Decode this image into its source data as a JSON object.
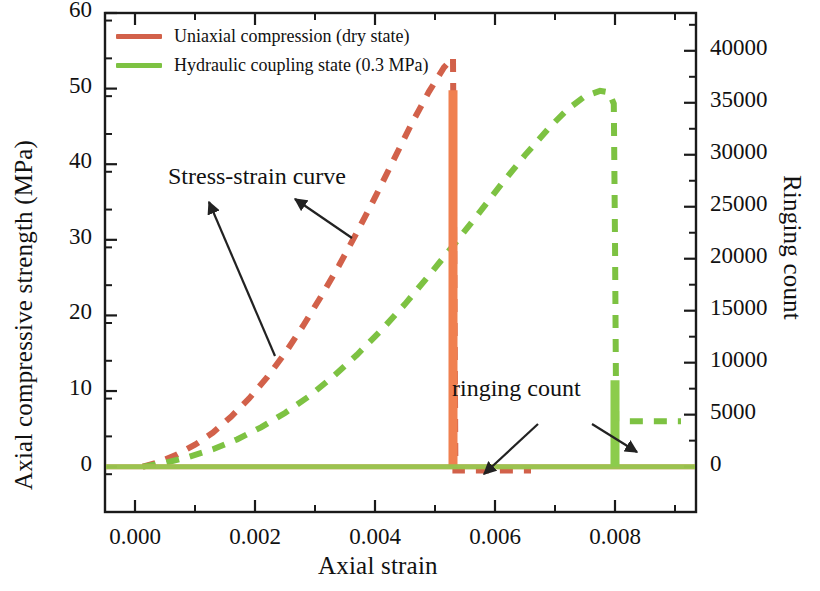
{
  "chart_data": {
    "type": "line",
    "title": "",
    "xlabel": "Axial strain",
    "ylabel": "Axial compressive strength (MPa)",
    "y2label": "Ringing count",
    "xlim": [
      -0.0005,
      0.00935
    ],
    "ylim": [
      -6,
      60
    ],
    "y2lim": [
      -4364,
      43636
    ],
    "xticks": [
      0.0,
      0.002,
      0.004,
      0.006,
      0.008
    ],
    "xticklabels": [
      "0.000",
      "0.002",
      "0.004",
      "0.006",
      "0.008"
    ],
    "xminorticks": [
      0.001,
      0.003,
      0.005,
      0.007,
      0.009
    ],
    "yticks": [
      0,
      10,
      20,
      30,
      40,
      50,
      60
    ],
    "yticklabels": [
      "0",
      "10",
      "20",
      "30",
      "40",
      "50",
      "60"
    ],
    "y2ticks": [
      0,
      5000,
      10000,
      15000,
      20000,
      25000,
      30000,
      35000,
      40000
    ],
    "y2ticklabels": [
      "0",
      "5000",
      "10000",
      "15000",
      "20000",
      "25000",
      "30000",
      "35000",
      "40000"
    ],
    "grid": false,
    "legend_position": "upper left",
    "series": [
      {
        "name": "Uniaxial compression (dry state)",
        "color": "#d2614a",
        "axis": "left",
        "style": "dashed",
        "role": "stress-strain curve",
        "x": [
          0.00013,
          0.0004,
          0.0007,
          0.001,
          0.0013,
          0.0016,
          0.0019,
          0.0022,
          0.0025,
          0.0028,
          0.0031,
          0.0034,
          0.0037,
          0.004,
          0.0043,
          0.0046,
          0.0049,
          0.00515,
          0.0053,
          0.00532,
          0.00534,
          0.0056,
          0.006,
          0.0064,
          0.0066
        ],
        "y": [
          0.0,
          0.6,
          1.6,
          2.9,
          4.5,
          6.6,
          9.0,
          11.8,
          15.0,
          18.6,
          22.5,
          26.6,
          31.0,
          35.6,
          40.4,
          45.2,
          49.6,
          52.8,
          54.1,
          30.0,
          -0.5,
          -0.5,
          -0.5,
          -0.5,
          -0.5
        ]
      },
      {
        "name": "Hydraulic coupling state (0.3 MPa)",
        "color": "#7dc242",
        "axis": "left",
        "style": "dashed",
        "role": "stress-strain curve",
        "x": [
          0.00013,
          0.0005,
          0.0009,
          0.0013,
          0.0017,
          0.0021,
          0.0025,
          0.0029,
          0.0033,
          0.0037,
          0.0041,
          0.0045,
          0.0049,
          0.0053,
          0.0057,
          0.0061,
          0.0065,
          0.0069,
          0.0072,
          0.0075,
          0.00775,
          0.0079,
          0.00798,
          0.008,
          0.00802,
          0.0083,
          0.0087,
          0.0091
        ],
        "y": [
          0.0,
          0.5,
          1.3,
          2.3,
          3.6,
          5.2,
          7.1,
          9.3,
          11.9,
          14.8,
          18.0,
          21.5,
          25.3,
          29.2,
          33.2,
          37.3,
          41.2,
          44.8,
          47.2,
          49.0,
          49.7,
          49.5,
          48.0,
          30.0,
          6.0,
          6.0,
          6.0,
          6.0
        ]
      },
      {
        "name": "Ringing count (dry state)",
        "color": "#f08050",
        "axis": "right",
        "style": "spike",
        "role": "ringing count",
        "x": [
          0.0053
        ],
        "y": [
          36200
        ],
        "baseline": 0
      },
      {
        "name": "Ringing count (hydraulic coupling state)",
        "color": "#8ccc4c",
        "axis": "right",
        "style": "spike",
        "role": "ringing count",
        "x": [
          0.008
        ],
        "y": [
          8300
        ],
        "baseline": 0
      }
    ],
    "annotations": [
      {
        "text": "Stress-strain curve",
        "x_px": 168,
        "y_px": 163
      },
      {
        "text": "ringing count",
        "x_px": 452,
        "y_px": 375
      }
    ]
  },
  "legend": {
    "items": [
      {
        "label": "Uniaxial compression (dry state)",
        "color": "#d2614a"
      },
      {
        "label": "Hydraulic coupling state (0.3 MPa)",
        "color": "#7dc242"
      }
    ]
  },
  "axes": {
    "left_title": "Axial compressive strength (MPa)",
    "right_title": "Ringing count",
    "bottom_title": "Axial strain",
    "left_ticks": [
      "60",
      "50",
      "40",
      "30",
      "20",
      "10",
      "0"
    ],
    "right_ticks": [
      "40000",
      "35000",
      "30000",
      "25000",
      "20000",
      "15000",
      "10000",
      "5000",
      "0"
    ],
    "bottom_ticks": [
      "0.000",
      "0.002",
      "0.004",
      "0.006",
      "0.008"
    ]
  },
  "annotations": {
    "stress_strain": "Stress-strain curve",
    "ringing_count": "ringing count"
  },
  "colors": {
    "orange_dash": "#d2614a",
    "green_dash": "#7dc242",
    "orange_spike": "#f08050",
    "green_spike": "#8ccc4c",
    "axis": "#1a1a1a",
    "text": "#111111"
  }
}
